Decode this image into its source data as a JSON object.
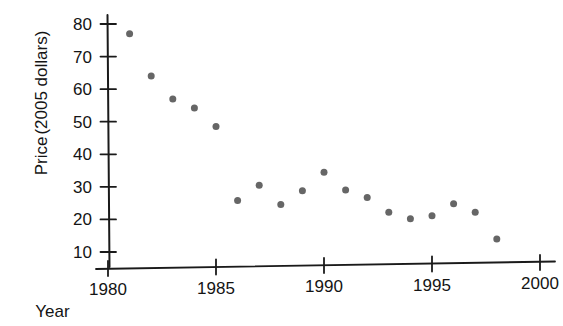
{
  "chart_data": {
    "type": "scatter",
    "title": "",
    "xlabel": "Year",
    "ylabel": "Price (2005 dollars)",
    "ylabel_lines": [
      "Price",
      "(2005 dollars)"
    ],
    "xlim": [
      1980,
      2000
    ],
    "ylim": [
      5,
      82
    ],
    "grid": false,
    "legend": null,
    "xticks": [
      1980,
      1985,
      1990,
      1995,
      2000
    ],
    "xtick_labels": [
      "1980",
      "1985",
      "1990",
      "1995",
      "2000"
    ],
    "yticks": [
      10,
      20,
      30,
      40,
      50,
      60,
      70,
      80
    ],
    "ytick_labels": [
      "10",
      "20",
      "30",
      "40",
      "50",
      "60",
      "70",
      "80"
    ],
    "marker": {
      "shape": "circle",
      "color": "#666666",
      "size_px": 7
    },
    "axis_color": "#1a1a1a",
    "background_color": "#ffffff",
    "x": [
      1981,
      1982,
      1983,
      1984,
      1985,
      1986,
      1987,
      1988,
      1989,
      1990,
      1991,
      1992,
      1993,
      1994,
      1995,
      1996,
      1997,
      1998
    ],
    "y": [
      77.0,
      64.0,
      57.0,
      54.2,
      48.5,
      25.8,
      30.5,
      24.6,
      28.8,
      34.5,
      29.0,
      26.7,
      22.2,
      20.2,
      21.1,
      24.8,
      22.2,
      14.0
    ],
    "points": [
      {
        "year": 1981,
        "price": 77.0
      },
      {
        "year": 1982,
        "price": 64.0
      },
      {
        "year": 1983,
        "price": 57.0
      },
      {
        "year": 1984,
        "price": 54.2
      },
      {
        "year": 1985,
        "price": 48.5
      },
      {
        "year": 1986,
        "price": 25.8
      },
      {
        "year": 1987,
        "price": 30.5
      },
      {
        "year": 1988,
        "price": 24.6
      },
      {
        "year": 1989,
        "price": 28.8
      },
      {
        "year": 1990,
        "price": 34.5
      },
      {
        "year": 1991,
        "price": 29.0
      },
      {
        "year": 1992,
        "price": 26.7
      },
      {
        "year": 1993,
        "price": 22.2
      },
      {
        "year": 1994,
        "price": 20.2
      },
      {
        "year": 1995,
        "price": 21.1
      },
      {
        "year": 1996,
        "price": 24.8
      },
      {
        "year": 1997,
        "price": 22.2
      },
      {
        "year": 1998,
        "price": 14.0
      }
    ]
  }
}
